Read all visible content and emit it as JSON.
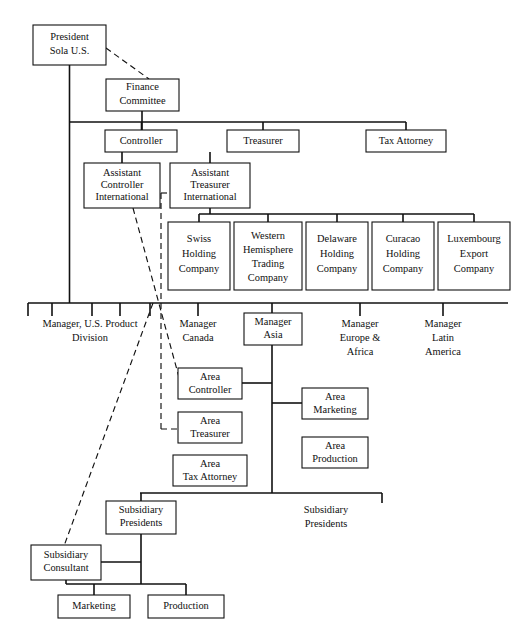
{
  "chart_title": "Organization Chart - Sola U.S.",
  "diagram": {
    "type": "org-chart",
    "background": "#ffffff",
    "line_color": "#111111",
    "box_fill": "#ffffff"
  },
  "nodes": {
    "president": {
      "label_lines": [
        "President",
        "Sola U.S."
      ],
      "x": 33,
      "y": 25,
      "w": 73,
      "h": 40
    },
    "finance_committee": {
      "label_lines": [
        "Finance",
        "Committee"
      ],
      "x": 106,
      "y": 79,
      "w": 73,
      "h": 32
    },
    "controller": {
      "label_lines": [
        "Controller"
      ],
      "x": 105,
      "y": 130,
      "w": 72,
      "h": 22
    },
    "treasurer": {
      "label_lines": [
        "Treasurer"
      ],
      "x": 227,
      "y": 130,
      "w": 72,
      "h": 22
    },
    "tax_attorney_hq": {
      "label_lines": [
        "Tax Attorney"
      ],
      "x": 366,
      "y": 130,
      "w": 80,
      "h": 22
    },
    "assistant_controller_international": {
      "label_lines": [
        "Assistant",
        "Controller",
        "International"
      ],
      "x": 84,
      "y": 163,
      "w": 76,
      "h": 45
    },
    "assistant_treasurer_international": {
      "label_lines": [
        "Assistant",
        "Treasurer",
        "International"
      ],
      "x": 170,
      "y": 163,
      "w": 80,
      "h": 45
    },
    "swiss_holding_company": {
      "label_lines": [
        "Swiss",
        "Holding",
        "Company"
      ],
      "x": 168,
      "y": 222,
      "w": 62,
      "h": 68
    },
    "western_hemisphere_trading_company": {
      "label_lines": [
        "Western",
        "Hemisphere",
        "Trading",
        "Company"
      ],
      "x": 234,
      "y": 222,
      "w": 68,
      "h": 68
    },
    "delaware_holding_company": {
      "label_lines": [
        "Delaware",
        "Holding",
        "Company"
      ],
      "x": 306,
      "y": 222,
      "w": 62,
      "h": 68
    },
    "curacao_holding_company": {
      "label_lines": [
        "Curacao",
        "Holding",
        "Company"
      ],
      "x": 372,
      "y": 222,
      "w": 62,
      "h": 68
    },
    "luxembourg_export_company": {
      "label_lines": [
        "Luxembourg",
        "Export",
        "Company"
      ],
      "x": 438,
      "y": 222,
      "w": 72,
      "h": 68
    },
    "manager_asia": {
      "label_lines": [
        "Manager",
        "Asia"
      ],
      "x": 244,
      "y": 313,
      "w": 58,
      "h": 32
    },
    "area_controller": {
      "label_lines": [
        "Area",
        "Controller"
      ],
      "x": 178,
      "y": 368,
      "w": 64,
      "h": 31
    },
    "area_treasurer": {
      "label_lines": [
        "Area",
        "Treasurer"
      ],
      "x": 178,
      "y": 412,
      "w": 64,
      "h": 31
    },
    "area_tax_attorney": {
      "label_lines": [
        "Area",
        "Tax Attorney"
      ],
      "x": 173,
      "y": 455,
      "w": 74,
      "h": 31
    },
    "area_marketing": {
      "label_lines": [
        "Area",
        "Marketing"
      ],
      "x": 302,
      "y": 388,
      "w": 66,
      "h": 31
    },
    "area_production": {
      "label_lines": [
        "Area",
        "Production"
      ],
      "x": 302,
      "y": 437,
      "w": 66,
      "h": 31
    },
    "subsidiary_presidents_box": {
      "label_lines": [
        "Subsidiary",
        "Presidents"
      ],
      "x": 106,
      "y": 501,
      "w": 70,
      "h": 33
    },
    "subsidiary_consultant": {
      "label_lines": [
        "Subsidiary",
        "Consultant"
      ],
      "x": 31,
      "y": 545,
      "w": 70,
      "h": 35
    },
    "marketing": {
      "label_lines": [
        "Marketing"
      ],
      "x": 58,
      "y": 595,
      "w": 72,
      "h": 23
    },
    "production": {
      "label_lines": [
        "Production"
      ],
      "x": 148,
      "y": 595,
      "w": 76,
      "h": 23
    }
  },
  "free_labels": {
    "manager_us_product_division": {
      "label_lines": [
        "Manager, U.S. Product",
        "Division"
      ],
      "cx": 90,
      "cy": 325
    },
    "manager_canada": {
      "label_lines": [
        "Manager",
        "Canada"
      ],
      "cx": 198,
      "cy": 325
    },
    "manager_europe_africa": {
      "label_lines": [
        "Manager",
        "Europe &",
        "Africa"
      ],
      "cx": 360,
      "cy": 330
    },
    "manager_latin_america": {
      "label_lines": [
        "Manager",
        "Latin",
        "America"
      ],
      "cx": 443,
      "cy": 330
    },
    "subsidiary_presidents_text": {
      "label_lines": [
        "Subsidiary",
        "Presidents"
      ],
      "cx": 326,
      "cy": 517
    }
  },
  "rails": {
    "executive_rail": {
      "y": 122,
      "x1": 74,
      "x2": 406
    },
    "holding_rail": {
      "y": 214,
      "x1": 176,
      "x2": 475
    },
    "division_rail": {
      "y": 303,
      "x1": 28,
      "x2": 508
    },
    "division_rail_ticks": [
      28,
      52,
      92,
      120,
      150,
      198,
      272,
      360,
      443
    ],
    "subsidiary_rail": {
      "y": 493,
      "x1": 140,
      "x2": 382
    }
  },
  "dashed_links": [
    {
      "name": "president-to-finance-committee",
      "from": [
        106,
        51
      ],
      "to": [
        150,
        79
      ]
    },
    {
      "name": "assistant-controller-to-area-controller",
      "from": [
        131,
        208
      ],
      "to": [
        178,
        382
      ]
    },
    {
      "name": "assistant-controller-vertical-to-area-treasurer",
      "from": [
        160,
        190
      ],
      "to": [
        160,
        429
      ]
    },
    {
      "name": "assistant-treasurer-stub",
      "from": [
        160,
        190
      ],
      "to": [
        170,
        190
      ]
    },
    {
      "name": "area-treasurer-dashed-in",
      "from": [
        160,
        429
      ],
      "to": [
        178,
        429
      ]
    },
    {
      "name": "division-to-subsidiary-consultant",
      "from": [
        152,
        303
      ],
      "to": [
        66,
        545
      ]
    }
  ],
  "legend": {
    "solid_line_meaning": "line authority",
    "dashed_line_meaning": "functional / staff relationship"
  }
}
